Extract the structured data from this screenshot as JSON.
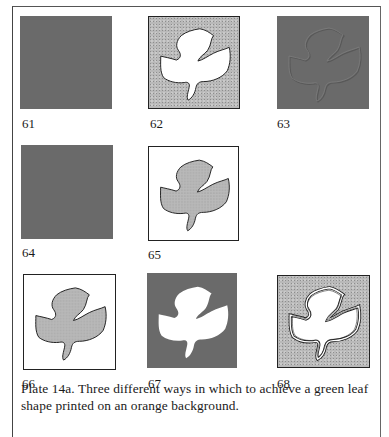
{
  "figure": {
    "panels": [
      {
        "number": "61",
        "style": "solid-background",
        "description": "plain orange background, no leaf"
      },
      {
        "number": "62",
        "style": "background-with-leaf-knockout",
        "description": "stippled background with white leaf-shaped cut-out"
      },
      {
        "number": "63",
        "style": "overprint-embossed",
        "description": "solid background with faint leaf outline"
      },
      {
        "number": "64",
        "style": "solid-background",
        "description": "plain orange background, no leaf"
      },
      {
        "number": "65",
        "style": "leaf-on-white",
        "description": "stippled leaf on white with frame"
      },
      {
        "number": "66",
        "style": "leaf-on-white",
        "description": "stippled leaf on white with frame"
      },
      {
        "number": "67",
        "style": "solid-with-white-leaf",
        "description": "solid background with white leaf"
      },
      {
        "number": "68",
        "style": "stippled-with-outlined-leaf",
        "description": "stippled background with double-outlined white leaf"
      }
    ],
    "caption_line1": "Plate 14a.  Three different ways in which to achieve a green leaf",
    "caption_line2": "shape printed on an orange background."
  },
  "colors": {
    "solid_gray": "#6a6a6a",
    "stipple_gray": "#b9b9b9",
    "outline": "#222222",
    "paper": "#ffffff"
  }
}
